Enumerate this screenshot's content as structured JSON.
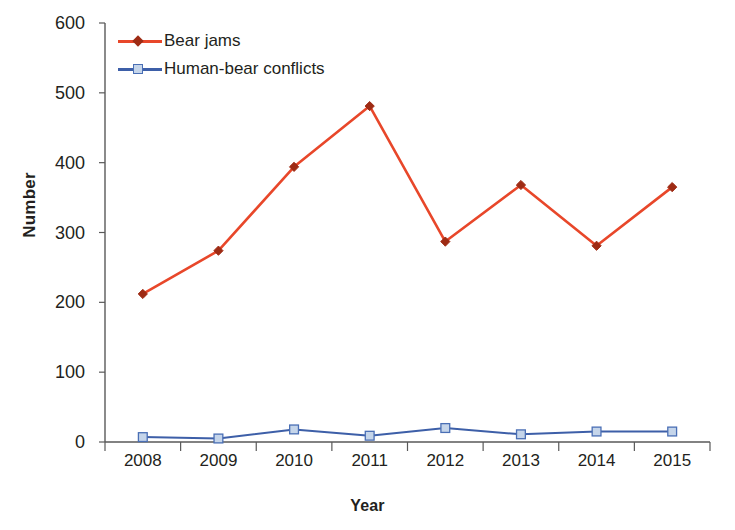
{
  "chart_data": {
    "type": "line",
    "title": "",
    "xlabel": "Year",
    "ylabel": "Number",
    "categories": [
      "2008",
      "2009",
      "2010",
      "2011",
      "2012",
      "2013",
      "2014",
      "2015"
    ],
    "ylim": [
      0,
      600
    ],
    "y_ticks": [
      "0",
      "100",
      "200",
      "300",
      "400",
      "500",
      "600"
    ],
    "y_tick_values": [
      0,
      100,
      200,
      300,
      400,
      500,
      600
    ],
    "grid": false,
    "legend_position": "top-left",
    "series": [
      {
        "name": "Bear jams",
        "values": [
          212,
          274,
          394,
          481,
          287,
          368,
          281,
          365
        ],
        "line_color": "#E8472A",
        "marker_color": "#9E2B14",
        "marker": "diamond"
      },
      {
        "name": "Human-bear conflicts",
        "values": [
          7,
          5,
          18,
          9,
          20,
          11,
          15,
          15
        ],
        "line_color": "#3D5FA8",
        "marker_color": "#C5D5EA",
        "marker_edge_color": "#4A6FB5",
        "marker": "square"
      }
    ]
  },
  "axis": {
    "line_color": "#595959",
    "tick_color": "#595959"
  }
}
